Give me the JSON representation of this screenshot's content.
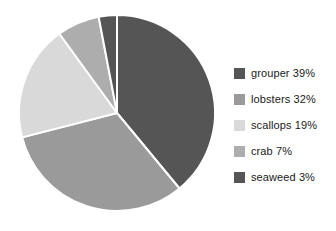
{
  "chart_data": {
    "type": "pie",
    "title": "",
    "subtitle": "",
    "xlabel": "",
    "ylabel": "",
    "grid": false,
    "legend_position": "right",
    "start_angle_deg": 0,
    "direction": "clockwise",
    "categories": [
      "grouper",
      "lobsters",
      "scallops",
      "crab",
      "seaweed"
    ],
    "values": [
      39,
      32,
      19,
      7,
      3
    ],
    "units": "%",
    "slices": [
      {
        "label": "grouper",
        "value": 39,
        "legend_text": "grouper 39%",
        "color": "#555555",
        "sweep_deg": 140.4
      },
      {
        "label": "lobsters",
        "value": 32,
        "legend_text": "lobsters 32%",
        "color": "#9a9a9a",
        "sweep_deg": 115.2
      },
      {
        "label": "scallops",
        "value": 19,
        "legend_text": "scallops 19%",
        "color": "#d9d9d9",
        "sweep_deg": 68.4
      },
      {
        "label": "crab",
        "value": 7,
        "legend_text": "crab 7%",
        "color": "#adadad",
        "sweep_deg": 25.2
      },
      {
        "label": "seaweed",
        "value": 3,
        "legend_text": "seaweed 3%",
        "color": "#555555",
        "sweep_deg": 10.8
      }
    ],
    "separator_color": "#ffffff",
    "background_color": "#ffffff"
  },
  "legend": {
    "entries": [
      {
        "text": "grouper 39%",
        "color": "#555555"
      },
      {
        "text": "lobsters 32%",
        "color": "#9a9a9a"
      },
      {
        "text": "scallops 19%",
        "color": "#d9d9d9"
      },
      {
        "text": "crab 7%",
        "color": "#adadad"
      },
      {
        "text": "seaweed 3%",
        "color": "#555555"
      }
    ]
  }
}
